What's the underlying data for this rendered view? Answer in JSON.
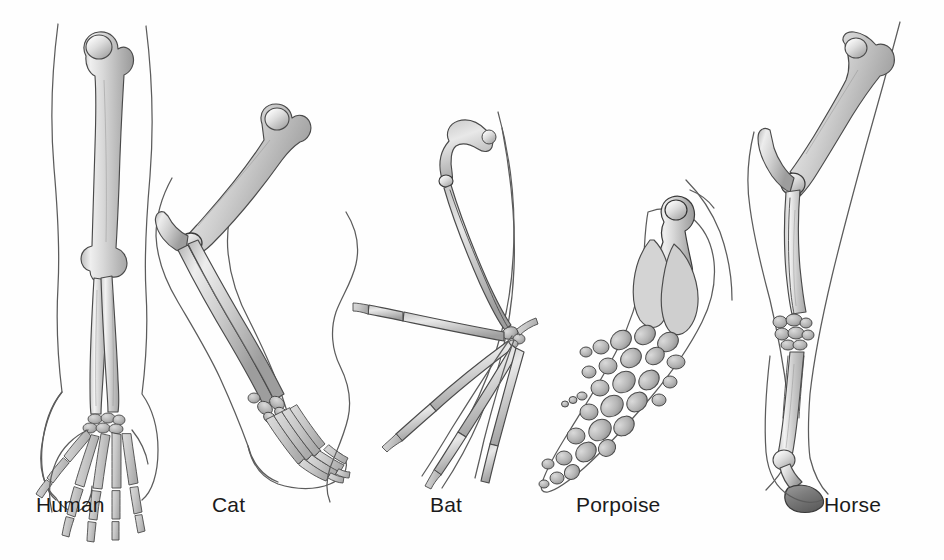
{
  "figure": {
    "kind": "scientific-illustration",
    "background_color": "#fefefe",
    "outline_color": "#5c5c5c",
    "bone_fill_light": "#e2e2e2",
    "bone_fill_mid": "#c4c4c4",
    "bone_fill_dark": "#a3a3a3",
    "label_color": "#1b1b1b"
  },
  "specimens": [
    {
      "id": "human",
      "label": "Human",
      "label_x": 36,
      "label_y": 512,
      "parts": [
        "humerus",
        "radius",
        "ulna",
        "carpals",
        "metacarpals",
        "phalanges"
      ]
    },
    {
      "id": "cat",
      "label": "Cat",
      "label_x": 212,
      "label_y": 512,
      "parts": [
        "humerus",
        "radius",
        "ulna",
        "carpals",
        "metacarpals",
        "phalanges"
      ]
    },
    {
      "id": "bat",
      "label": "Bat",
      "label_x": 430,
      "label_y": 512,
      "parts": [
        "humerus",
        "radius",
        "ulna",
        "carpals",
        "metacarpals",
        "phalanges"
      ]
    },
    {
      "id": "porpoise",
      "label": "Porpoise",
      "label_x": 576,
      "label_y": 512,
      "parts": [
        "humerus",
        "radius",
        "ulna",
        "carpals",
        "metacarpals",
        "phalanges"
      ]
    },
    {
      "id": "horse",
      "label": "Horse",
      "label_x": 824,
      "label_y": 512,
      "parts": [
        "humerus",
        "radius",
        "ulna",
        "carpals",
        "metacarpals",
        "phalanges",
        "hoof"
      ]
    }
  ]
}
